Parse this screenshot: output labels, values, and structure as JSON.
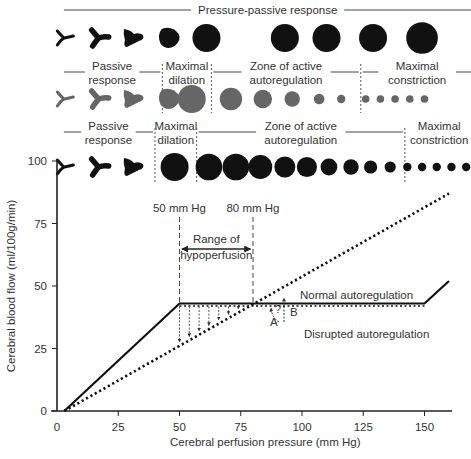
{
  "rows": [
    {
      "color": "#111111",
      "headers": [
        {
          "lines": [
            "Pressure-passive response"
          ],
          "x_from": 2,
          "x_to": 170
        }
      ],
      "dividers": [],
      "vessels": [
        {
          "shape": "y-thin",
          "x": 3
        },
        {
          "shape": "y-thick",
          "x": 17
        },
        {
          "shape": "trefoil",
          "x": 31
        },
        {
          "shape": "blob",
          "x": 46
        },
        {
          "shape": "circle",
          "x": 61,
          "r": 1.0
        },
        {
          "shape": "circle",
          "x": 93,
          "r": 1.0
        },
        {
          "shape": "circle",
          "x": 110,
          "r": 1.0
        },
        {
          "shape": "circle",
          "x": 129,
          "r": 1.0
        },
        {
          "shape": "circle",
          "x": 149,
          "r": 1.13
        }
      ]
    },
    {
      "color": "#666666",
      "headers": [
        {
          "lines": [
            "Passive",
            "response"
          ],
          "x_from": 2,
          "x_to": 43
        },
        {
          "lines": [
            "Maximal",
            "dilation"
          ],
          "x_from": 43,
          "x_to": 63
        },
        {
          "lines": [
            "Zone of active",
            "autoregulation"
          ],
          "x_from": 63,
          "x_to": 124
        },
        {
          "lines": [
            "Maximal",
            "constriction"
          ],
          "x_from": 124,
          "x_to": 170
        }
      ],
      "dividers": [
        43,
        63,
        124
      ],
      "vessels": [
        {
          "shape": "y-thin",
          "x": 3
        },
        {
          "shape": "y-thick",
          "x": 17
        },
        {
          "shape": "trefoil",
          "x": 31
        },
        {
          "shape": "blob",
          "x": 46
        },
        {
          "shape": "circle",
          "x": 55,
          "r": 1.0
        },
        {
          "shape": "circle",
          "x": 71,
          "r": 0.8
        },
        {
          "shape": "circle",
          "x": 84,
          "r": 0.66
        },
        {
          "shape": "circle",
          "x": 96,
          "r": 0.55
        },
        {
          "shape": "circle",
          "x": 107,
          "r": 0.38
        },
        {
          "shape": "circle",
          "x": 116,
          "r": 0.3
        },
        {
          "shape": "circle",
          "x": 126,
          "r": 0.27
        },
        {
          "shape": "circle",
          "x": 132,
          "r": 0.27
        },
        {
          "shape": "circle",
          "x": 138,
          "r": 0.27
        },
        {
          "shape": "circle",
          "x": 144,
          "r": 0.27
        },
        {
          "shape": "circle",
          "x": 150,
          "r": 0.27
        }
      ]
    },
    {
      "color": "#111111",
      "headers": [
        {
          "lines": [
            "Passive",
            "response"
          ],
          "x_from": 2,
          "x_to": 40
        },
        {
          "lines": [
            "Maximal",
            "dilation"
          ],
          "x_from": 40,
          "x_to": 57
        },
        {
          "lines": [
            "Zone of active",
            "autoregulation"
          ],
          "x_from": 57,
          "x_to": 142
        },
        {
          "lines": [
            "Maximal",
            "constriction"
          ],
          "x_from": 142,
          "x_to": 170
        }
      ],
      "dividers": [
        40,
        57,
        142
      ],
      "vessels": [
        {
          "shape": "y-thin",
          "x": 3
        },
        {
          "shape": "y-thick",
          "x": 17
        },
        {
          "shape": "trefoil",
          "x": 31
        },
        {
          "shape": "circle",
          "x": 48,
          "r": 1.0
        },
        {
          "shape": "circle",
          "x": 62,
          "r": 0.95
        },
        {
          "shape": "circle",
          "x": 73,
          "r": 0.95
        },
        {
          "shape": "circle",
          "x": 83,
          "r": 0.85
        },
        {
          "shape": "circle",
          "x": 93,
          "r": 0.75
        },
        {
          "shape": "circle",
          "x": 102,
          "r": 0.72
        },
        {
          "shape": "circle",
          "x": 111,
          "r": 0.6
        },
        {
          "shape": "circle",
          "x": 120,
          "r": 0.55
        },
        {
          "shape": "circle",
          "x": 128,
          "r": 0.47
        },
        {
          "shape": "circle",
          "x": 136,
          "r": 0.4
        },
        {
          "shape": "circle",
          "x": 143,
          "r": 0.3
        },
        {
          "shape": "circle",
          "x": 149,
          "r": 0.3
        },
        {
          "shape": "circle",
          "x": 155,
          "r": 0.3
        },
        {
          "shape": "circle",
          "x": 161,
          "r": 0.3
        },
        {
          "shape": "circle",
          "x": 167,
          "r": 0.3
        }
      ]
    }
  ],
  "chart_data": {
    "type": "line",
    "title": "",
    "xlabel": "Cerebral perfusion pressure (mm Hg)",
    "ylabel": "Cerebral blood flow (ml/100g/min)",
    "xlim": [
      0,
      160
    ],
    "ylim": [
      0,
      100
    ],
    "xticks": [
      0,
      25,
      50,
      75,
      100,
      125,
      150
    ],
    "yticks": [
      0,
      25,
      50,
      75,
      100
    ],
    "grid": false,
    "series": [
      {
        "name": "Normal autoregulation",
        "style": "solid",
        "points": [
          [
            3,
            0
          ],
          [
            50,
            43
          ],
          [
            150,
            43
          ],
          [
            160,
            52
          ]
        ]
      },
      {
        "name": "Disrupted autoregulation",
        "style": "dotted",
        "points": [
          [
            3,
            0
          ],
          [
            160,
            87
          ]
        ]
      }
    ],
    "markers": [
      {
        "label": "50 mm Hg",
        "x": 50
      },
      {
        "label": "80 mm Hg",
        "x": 80
      }
    ],
    "range_label": [
      "Range of",
      "hypoperfusion"
    ],
    "drop_arrows_x": [
      50,
      54,
      58,
      62,
      66,
      70,
      74
    ],
    "annotations": {
      "normal_label": "Normal autoregulation",
      "disrupted_label": "Disrupted autoregulation",
      "point_a": "A",
      "point_b": "B",
      "question": "?"
    }
  }
}
